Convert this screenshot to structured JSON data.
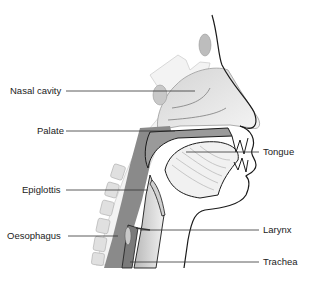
{
  "diagram": {
    "labels_left": [
      {
        "id": "nasal-cavity",
        "text": "Nasal cavity"
      },
      {
        "id": "palate",
        "text": "Palate"
      },
      {
        "id": "epiglottis",
        "text": "Epiglottis"
      },
      {
        "id": "oesophagus",
        "text": "Oesophagus"
      }
    ],
    "labels_right": [
      {
        "id": "tongue",
        "text": "Tongue"
      },
      {
        "id": "larynx",
        "text": "Larynx"
      },
      {
        "id": "trachea",
        "text": "Trachea"
      }
    ],
    "colors": {
      "outline": "#1a1a1a",
      "leader": "#333333",
      "airway": "#8a8a8a",
      "tissue_light": "#e6e6e6",
      "tissue_mid": "#cfcfcf",
      "bone": "#f2f2f2",
      "spine": "#bdbdbd"
    }
  }
}
